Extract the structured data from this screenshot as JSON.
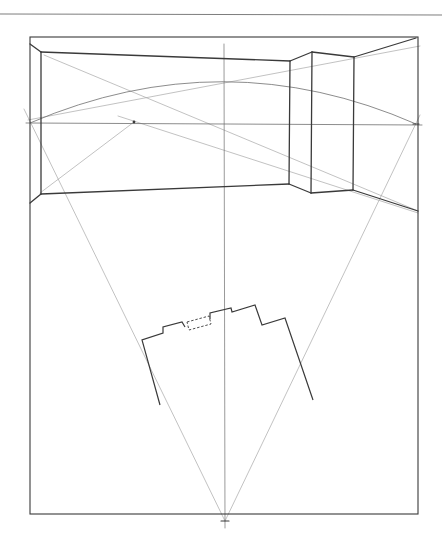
{
  "drawing": {
    "type": "two-point perspective construction sketch",
    "caption": "",
    "colors": {
      "paper": "#ffffff",
      "ink_dark": "#3a3a3a",
      "ink_medium": "#6e6e6e",
      "ink_light": "#a8a8a8"
    },
    "page_top_rule": {
      "x1": 0,
      "y1": 14,
      "x2": 442,
      "y2": 15
    },
    "picture_plane_frame": {
      "x": 30,
      "y": 37,
      "w": 388,
      "h": 477
    },
    "horizon_line": {
      "x1": 26,
      "y1": 123,
      "x2": 422,
      "y2": 125
    },
    "center_vertical": {
      "x1": 224,
      "y1": 44,
      "x2": 225,
      "y2": 528
    },
    "station_point": {
      "x": 225,
      "y": 521
    },
    "vanishing_points": {
      "left": {
        "x": 134,
        "y": 122
      },
      "right": {
        "x": 416,
        "y": 124
      }
    },
    "room_edges": [
      {
        "x1": 30,
        "y1": 44,
        "x2": 41,
        "y2": 52
      },
      {
        "x1": 41,
        "y1": 52,
        "x2": 41,
        "y2": 194
      },
      {
        "x1": 30,
        "y1": 203,
        "x2": 41,
        "y2": 194
      },
      {
        "x1": 41,
        "y1": 52,
        "x2": 290,
        "y2": 61
      },
      {
        "x1": 41,
        "y1": 194,
        "x2": 289,
        "y2": 184
      },
      {
        "x1": 290,
        "y1": 61,
        "x2": 312,
        "y2": 52
      },
      {
        "x1": 312,
        "y1": 52,
        "x2": 354,
        "y2": 57
      },
      {
        "x1": 354,
        "y1": 57,
        "x2": 416,
        "y2": 38
      },
      {
        "x1": 290,
        "y1": 61,
        "x2": 289,
        "y2": 184
      },
      {
        "x1": 312,
        "y1": 52,
        "x2": 311,
        "y2": 193
      },
      {
        "x1": 354,
        "y1": 57,
        "x2": 353,
        "y2": 190
      },
      {
        "x1": 289,
        "y1": 184,
        "x2": 311,
        "y2": 193
      },
      {
        "x1": 311,
        "y1": 193,
        "x2": 353,
        "y2": 190
      },
      {
        "x1": 353,
        "y1": 190,
        "x2": 418,
        "y2": 211
      }
    ],
    "construction_lines": [
      {
        "x1": 44,
        "y1": 55,
        "x2": 418,
        "y2": 211
      },
      {
        "x1": 28,
        "y1": 120,
        "x2": 420,
        "y2": 46
      },
      {
        "x1": 40,
        "y1": 193,
        "x2": 134,
        "y2": 122
      },
      {
        "x1": 118,
        "y1": 116,
        "x2": 418,
        "y2": 213
      },
      {
        "x1": 24,
        "y1": 109,
        "x2": 225,
        "y2": 521
      },
      {
        "x1": 420,
        "y1": 115,
        "x2": 225,
        "y2": 521
      }
    ],
    "arc": {
      "d": "M 30 123 Q 224 40 416 124"
    },
    "plan_outline": {
      "solid": [
        [
          160,
          405
        ],
        [
          142,
          340
        ],
        [
          163,
          333
        ],
        [
          163,
          327
        ],
        [
          182,
          322
        ],
        [
          185,
          327
        ]
      ],
      "solid_right": [
        [
          210,
          319
        ],
        [
          210,
          313
        ],
        [
          231,
          308
        ],
        [
          232,
          312
        ],
        [
          255,
          305
        ],
        [
          262,
          325
        ],
        [
          285,
          318
        ],
        [
          313,
          400
        ]
      ],
      "dashed_rect": [
        [
          187,
          322
        ],
        [
          209,
          316
        ],
        [
          211,
          324
        ],
        [
          189,
          330
        ]
      ]
    }
  }
}
